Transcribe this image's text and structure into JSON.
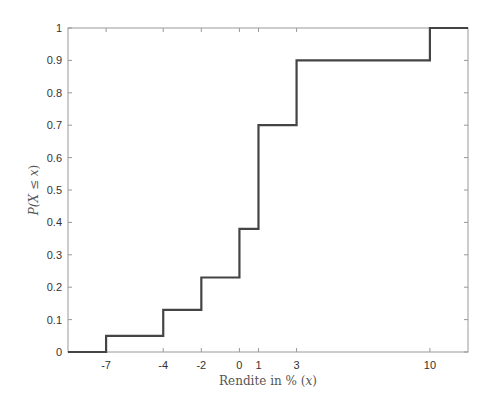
{
  "chart_data": {
    "type": "line",
    "subtype": "step",
    "title": "",
    "xlabel": "Rendite in % (x)",
    "ylabel": "P(X ≤ x)",
    "xlim": [
      -9,
      12
    ],
    "ylim": [
      0,
      1
    ],
    "xticks": [
      -7,
      -4,
      -2,
      0,
      1,
      3,
      10
    ],
    "xtick_labels": [
      "-7",
      "-4",
      "-2",
      "0",
      "1",
      "3",
      "10"
    ],
    "yticks": [
      0,
      0.1,
      0.2,
      0.3,
      0.4,
      0.5,
      0.6,
      0.7,
      0.8,
      0.9,
      1
    ],
    "ytick_labels": [
      "0",
      "0.1",
      "0.2",
      "0.3",
      "0.4",
      "0.5",
      "0.6",
      "0.7",
      "0.8",
      "0.9",
      "1"
    ],
    "grid": false,
    "legend": null,
    "series": [
      {
        "name": "Empirical CDF",
        "color": "#444444",
        "x": [
          -9,
          -7,
          -4,
          -2,
          0,
          1,
          3,
          10,
          12
        ],
        "y": [
          0,
          0.05,
          0.13,
          0.23,
          0.38,
          0.7,
          0.9,
          1.0,
          1.0
        ],
        "step_points": [
          {
            "x": -7,
            "y_before": 0,
            "y_after": 0.05
          },
          {
            "x": -4,
            "y_before": 0.05,
            "y_after": 0.13
          },
          {
            "x": -2,
            "y_before": 0.13,
            "y_after": 0.23
          },
          {
            "x": 0,
            "y_before": 0.23,
            "y_after": 0.38
          },
          {
            "x": 1,
            "y_before": 0.38,
            "y_after": 0.7
          },
          {
            "x": 3,
            "y_before": 0.7,
            "y_after": 0.9
          },
          {
            "x": 10,
            "y_before": 0.9,
            "y_after": 1.0
          }
        ]
      }
    ]
  },
  "labels": {
    "xlabel_prefix": "Rendite in % (",
    "xlabel_var": "x",
    "xlabel_suffix": ")",
    "ylabel_prefix": "P(",
    "ylabel_var": "X ≤ x",
    "ylabel_suffix": ")"
  },
  "colors": {
    "axis": "#999999",
    "line": "#444444",
    "text": "#333333",
    "background": "#ffffff"
  }
}
